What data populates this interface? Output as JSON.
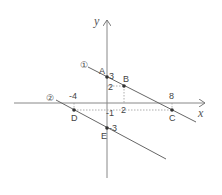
{
  "axes": {
    "x_label": "x",
    "y_label": "y"
  },
  "lines": [
    {
      "label": "①",
      "name": "line-1",
      "passes": [
        "A",
        "B",
        "C"
      ]
    },
    {
      "label": "②",
      "name": "line-2",
      "passes": [
        "D",
        "E"
      ]
    }
  ],
  "points": {
    "A": {
      "label": "A",
      "x": 0,
      "y": 3
    },
    "B": {
      "label": "B",
      "x": 2,
      "y": 2
    },
    "C": {
      "label": "C",
      "x": 8,
      "y": -1
    },
    "D": {
      "label": "D",
      "x": -4,
      "y": -1
    },
    "E": {
      "label": "E",
      "x": 0,
      "y": -3
    }
  },
  "ticks": {
    "y3": "3",
    "y2": "2",
    "ym1": "-1",
    "ym3": "-3",
    "x2": "2",
    "x8": "8",
    "xm4": "-4"
  }
}
